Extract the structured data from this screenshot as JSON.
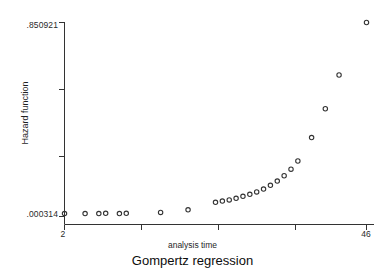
{
  "chart_data": {
    "type": "scatter",
    "title": "",
    "caption": "Gompertz regression",
    "xlabel": "analysis time",
    "ylabel": "Hazard function",
    "xlim": [
      2,
      46
    ],
    "ylim": [
      0.000314,
      0.850921
    ],
    "xticks": [
      2,
      13,
      24,
      35,
      46
    ],
    "xtick_labels": [
      "2",
      "",
      "",
      "",
      "46"
    ],
    "yticks": [
      0.000314,
      0.284183,
      0.568052,
      0.850921
    ],
    "ytick_labels": [
      ".000314",
      "",
      "",
      ".850921"
    ],
    "grid": false,
    "legend": false,
    "marker": "open-circle",
    "marker_color": "#333333",
    "axis_color": "#333333",
    "x": [
      2,
      5,
      7,
      8,
      10,
      11,
      16,
      20,
      24,
      25,
      26,
      27,
      28,
      29,
      30,
      31,
      32,
      33,
      34,
      35,
      36,
      38,
      40,
      42,
      46
    ],
    "y": [
      0.0131,
      0.0131,
      0.0131,
      0.0142,
      0.0131,
      0.0142,
      0.0184,
      0.0298,
      0.0626,
      0.0678,
      0.0732,
      0.0802,
      0.0888,
      0.0975,
      0.1082,
      0.1205,
      0.1368,
      0.1555,
      0.1789,
      0.2078,
      0.2437,
      0.3462,
      0.4727,
      0.6208,
      0.8509
    ]
  },
  "axis_titles": {
    "y": "Hazard function",
    "x": "analysis time"
  },
  "tick_labels": {
    "y_top": ".850921",
    "y_bottom": ".000314",
    "x_left": "2",
    "x_right": "46"
  },
  "caption": "Gompertz regression"
}
